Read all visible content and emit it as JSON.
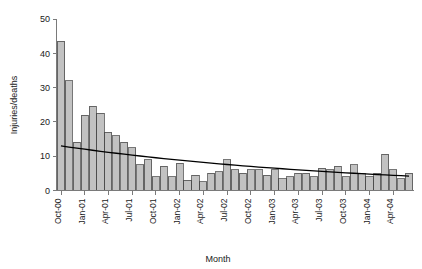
{
  "chart_data": {
    "type": "bar",
    "title": "",
    "subtitle": "",
    "xlabel": "Month",
    "ylabel": "Injuries/deaths",
    "grid": false,
    "legend": false,
    "legend_position": "none",
    "ylim": [
      0,
      50
    ],
    "yticks": [
      0,
      10,
      20,
      30,
      40,
      50
    ],
    "xtick_labels": [
      "Oct-00",
      "Jan-01",
      "Apr-01",
      "Jul-01",
      "Oct-01",
      "Jan-02",
      "Apr-02",
      "Jul-02",
      "Oct-02",
      "Jan-03",
      "Apr-03",
      "Jul-03",
      "Oct-03",
      "Jan-04",
      "Apr-04"
    ],
    "xtick_indices": [
      0,
      3,
      6,
      9,
      12,
      15,
      18,
      21,
      24,
      27,
      30,
      33,
      36,
      39,
      42
    ],
    "categories": [
      "Oct-00",
      "Nov-00",
      "Dec-00",
      "Jan-01",
      "Feb-01",
      "Mar-01",
      "Apr-01",
      "May-01",
      "Jun-01",
      "Jul-01",
      "Aug-01",
      "Sep-01",
      "Oct-01",
      "Nov-01",
      "Dec-01",
      "Jan-02",
      "Feb-02",
      "Mar-02",
      "Apr-02",
      "May-02",
      "Jun-02",
      "Jul-02",
      "Aug-02",
      "Sep-02",
      "Oct-02",
      "Nov-02",
      "Dec-02",
      "Jan-03",
      "Feb-03",
      "Mar-03",
      "Apr-03",
      "May-03",
      "Jun-03",
      "Jul-03",
      "Aug-03",
      "Sep-03",
      "Oct-03",
      "Nov-03",
      "Dec-03",
      "Jan-04",
      "Feb-04",
      "Mar-04",
      "Apr-04",
      "May-04",
      "Jun-04"
    ],
    "values": [
      43.5,
      32,
      14,
      22,
      24.5,
      22.5,
      17,
      16,
      14,
      12.5,
      7.5,
      9,
      4,
      7,
      4,
      8,
      3,
      4.5,
      2.5,
      5,
      5.5,
      9,
      6,
      5,
      6,
      6,
      4.5,
      6,
      3.5,
      4,
      5,
      5,
      4,
      6.5,
      6,
      7,
      4,
      7.5,
      5,
      4,
      5,
      10.5,
      6,
      3.5,
      5
    ],
    "bar_color": "#c2c2c2",
    "bar_edge_color": "#3d3d3d",
    "trend": {
      "label": "fitted trend",
      "color": "#000000",
      "type": "exponential-decay",
      "start_value": 13.0,
      "end_value": 4.2
    }
  },
  "axis": {
    "y_label": "Injuries/deaths",
    "x_label": "Month"
  }
}
